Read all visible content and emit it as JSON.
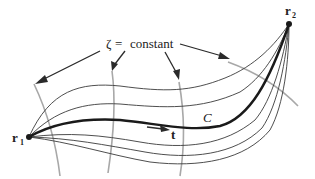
{
  "diagram": {
    "label_surface": {
      "zeta_symbol": "ζ",
      "equals": "=",
      "word": "constant"
    },
    "point_start": {
      "letter": "r",
      "subscript": "1"
    },
    "point_end": {
      "letter": "r",
      "subscript": "2"
    },
    "curve_label": "C",
    "tangent_label": "t",
    "colors": {
      "curves": "#3a3a3a",
      "main_curve": "#1a1a1a",
      "transverse_lines": "#a8a8a8",
      "background": "#ffffff"
    },
    "elements": {
      "family_curves_count": 6,
      "transverse_surfaces_count": 4,
      "arrows_from_label": 4
    }
  }
}
